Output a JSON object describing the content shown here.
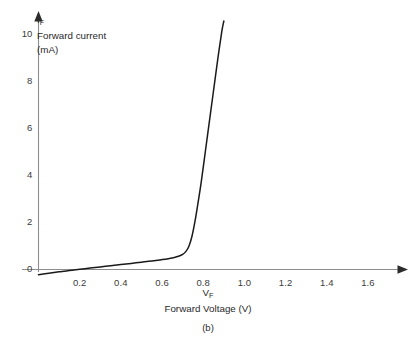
{
  "figure": {
    "caption": "(b)",
    "background_color": "#ffffff",
    "curve_color": "#1a1a1a",
    "axis_color": "#8d8d8d",
    "text_color": "#2a2a2a"
  },
  "y_axis": {
    "symbol": "I",
    "symbol_subscript": "F",
    "name_line": "Forward current",
    "unit_line": "(mA)",
    "ticks": [
      "0",
      "2",
      "4",
      "6",
      "8",
      "10"
    ],
    "tick_values": [
      0,
      2,
      4,
      6,
      8,
      10
    ]
  },
  "x_axis": {
    "symbol": "V",
    "symbol_subscript": "F",
    "name_line": "Forward Voltage (V)",
    "ticks": [
      "0.2",
      "0.4",
      "0.6",
      "0.8",
      "1.0",
      "1.2",
      "1.4",
      "1.6"
    ],
    "tick_values": [
      0.2,
      0.4,
      0.6,
      0.8,
      1.0,
      1.2,
      1.4,
      1.6
    ]
  },
  "chart_data": {
    "type": "line",
    "title": "",
    "subtitle": "",
    "xlabel": "V_F  Forward Voltage (V)",
    "ylabel": "I_F  Forward current (mA)",
    "xlim": [
      0.0,
      1.76
    ],
    "ylim": [
      -0.35,
      10.6
    ],
    "grid": false,
    "legend": null,
    "annotations": [
      "(b)"
    ],
    "series": [
      {
        "name": "Diode forward characteristic",
        "x": [
          0.0,
          0.05,
          0.1,
          0.15,
          0.2,
          0.25,
          0.3,
          0.35,
          0.4,
          0.45,
          0.5,
          0.55,
          0.6,
          0.63,
          0.66,
          0.68,
          0.7,
          0.715,
          0.73,
          0.745,
          0.76,
          0.775,
          0.79,
          0.81,
          0.83,
          0.85,
          0.87,
          0.89,
          0.9
        ],
        "y": [
          -0.22,
          -0.16,
          -0.1,
          -0.04,
          0.01,
          0.06,
          0.11,
          0.16,
          0.21,
          0.26,
          0.31,
          0.36,
          0.42,
          0.46,
          0.51,
          0.56,
          0.64,
          0.76,
          0.98,
          1.4,
          2.05,
          2.85,
          3.7,
          5.0,
          6.3,
          7.6,
          8.9,
          10.1,
          10.55
        ]
      }
    ]
  }
}
